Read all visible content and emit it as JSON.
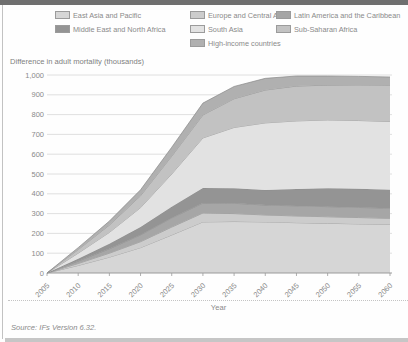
{
  "page": {
    "source": "Source: IFs Version 6.32."
  },
  "chart_data": {
    "type": "area",
    "stacked": true,
    "title": "Difference in adult mortality (thousands)",
    "xlabel": "Year",
    "x": [
      2005,
      2010,
      2015,
      2020,
      2025,
      2030,
      2035,
      2040,
      2045,
      2050,
      2055,
      2060
    ],
    "x_tick_labels": [
      "2005",
      "2010",
      "2015",
      "2020",
      "2025",
      "2030",
      "2035",
      "2040",
      "2045",
      "2050",
      "2055",
      "2060"
    ],
    "ylim": [
      0,
      1000
    ],
    "y_ticks": [
      {
        "value": 0,
        "label": "0"
      },
      {
        "value": 100,
        "label": "100"
      },
      {
        "value": 200,
        "label": "200"
      },
      {
        "value": 300,
        "label": "300"
      },
      {
        "value": 400,
        "label": "400"
      },
      {
        "value": 500,
        "label": "500"
      },
      {
        "value": 600,
        "label": "600"
      },
      {
        "value": 700,
        "label": "700"
      },
      {
        "value": 800,
        "label": "800"
      },
      {
        "value": 900,
        "label": "900"
      },
      {
        "value": 1000,
        "label": "1,000"
      }
    ],
    "grid": true,
    "legend_position": "top",
    "edge_color": "#8a8a8a",
    "axis_color": "#9a9a9a",
    "grid_color": "#d8d8d8",
    "series": [
      {
        "name": "East Asia and Pacific",
        "color": "#d6d6d6",
        "values": [
          0,
          38,
          80,
          128,
          192,
          258,
          260,
          258,
          254,
          251,
          248,
          245
        ]
      },
      {
        "name": "Europe and Central Asia",
        "color": "#cccccc",
        "values": [
          0,
          10,
          20,
          30,
          40,
          45,
          40,
          35,
          34,
          33,
          32,
          31
        ]
      },
      {
        "name": "Latin America and the Caribbean",
        "color": "#a6a6a6",
        "values": [
          0,
          12,
          22,
          34,
          46,
          50,
          52,
          50,
          51,
          51,
          51,
          51
        ]
      },
      {
        "name": "Middle East and North Africa",
        "color": "#949494",
        "values": [
          0,
          12,
          26,
          40,
          57,
          76,
          76,
          76,
          85,
          93,
          94,
          94
        ]
      },
      {
        "name": "South Asia",
        "color": "#e2e2e2",
        "values": [
          0,
          28,
          57,
          98,
          165,
          253,
          307,
          339,
          344,
          345,
          345,
          344
        ]
      },
      {
        "name": "Sub-Saharan Africa",
        "color": "#c2c2c2",
        "values": [
          0,
          18,
          37,
          60,
          90,
          116,
          145,
          166,
          176,
          176,
          180,
          183
        ]
      },
      {
        "name": "High-income countries",
        "color": "#b0b0b0",
        "values": [
          0,
          10,
          20,
          30,
          45,
          60,
          62,
          59,
          51,
          46,
          43,
          42
        ]
      }
    ],
    "legend_columns": [
      [
        "East Asia and Pacific",
        "Middle East and North Africa"
      ],
      [
        "Europe and Central Asia",
        "South Asia",
        "High-income countries"
      ],
      [
        "Latin America and the Caribbean",
        "Sub-Saharan Africa"
      ]
    ]
  }
}
